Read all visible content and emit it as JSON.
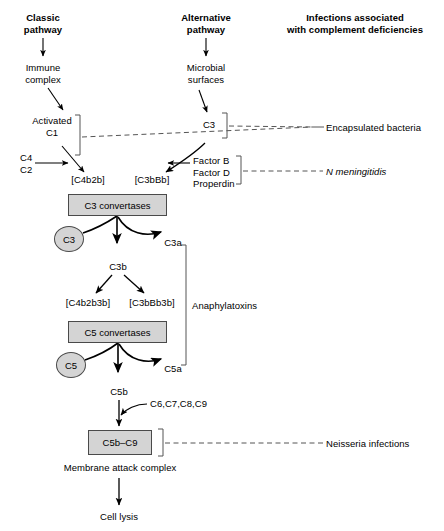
{
  "figure": {
    "title_classic": "Classic\npathway",
    "title_alternative": "Alternative\npathway",
    "title_infections": "Infections associated\nwith complement deficiencies"
  },
  "nodes": {
    "immune_complex": "Immune\ncomplex",
    "microbial_surfaces": "Microbial\nsurfaces",
    "activated_c1": "Activated\nC1",
    "c4c2": "C4\nC2",
    "c3_top": "C3",
    "c4b2b": "[C4b2b]",
    "c3bbb": "[C3bBb]",
    "factors": "Factor B\nFactor D\nProperdin",
    "c3_convertases": "C3 convertases",
    "c3_substrate": "C3",
    "c3a": "C3a",
    "c3b": "C3b",
    "c4b2b3b": "[C4b2b3b]",
    "c3bbb3b": "[C3bBb3b]",
    "anaphylatoxins": "Anaphylatoxins",
    "c5_convertases": "C5 convertases",
    "c5_substrate": "C5",
    "c5a": "C5a",
    "c5b": "C5b",
    "c6789": "C6,C7,C8,C9",
    "c5b_c9": "C5b–C9",
    "mac": "Membrane attack complex",
    "cell_lysis": "Cell lysis"
  },
  "deficiency_outcomes": {
    "encapsulated": "Encapsulated bacteria",
    "n_meningitidis": "N meningitidis",
    "neisseria": "Neisseria infections"
  },
  "colors": {
    "box_fill": "#d4d4d4",
    "box_stroke": "#4a4a4a",
    "line": "#000000",
    "bracket": "#555555",
    "text": "#000000",
    "background": "#ffffff"
  }
}
